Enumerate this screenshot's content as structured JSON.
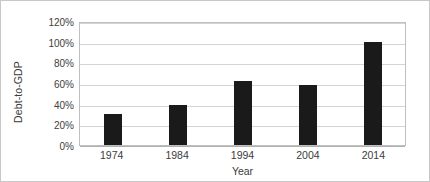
{
  "chart_data": {
    "type": "bar",
    "title": "",
    "subtitle": "",
    "xlabel": "Year",
    "ylabel": "Debt-to-GDP",
    "categories": [
      "1974",
      "1984",
      "1994",
      "2004",
      "2014"
    ],
    "values": [
      30,
      39,
      62,
      58,
      100
    ],
    "value_labels": [
      "30%",
      "39%",
      "62%",
      "58%",
      "100%"
    ],
    "ylim": [
      0,
      120
    ],
    "ytick_values": [
      0,
      20,
      40,
      60,
      80,
      100,
      120
    ],
    "ytick_labels": [
      "0%",
      "20%",
      "40%",
      "60%",
      "80%",
      "100%",
      "120%"
    ],
    "grid": "horizontal",
    "legend": "none",
    "series": [
      {
        "name": "Debt-to-GDP",
        "values": [
          30,
          39,
          62,
          58,
          100
        ],
        "color": "#1a1a1a"
      }
    ],
    "annotations": []
  },
  "style": {
    "bar_color": "#1a1a1a",
    "gridline_color": "#d4d4d4",
    "baseline_color": "#b0b0b0",
    "plot_border_color": "#bfbfbf",
    "frame_border_color": "#c8c8c8",
    "background_color": "#ffffff",
    "tick_label_color": "#404040",
    "axis_title_color": "#3b3b3b"
  }
}
